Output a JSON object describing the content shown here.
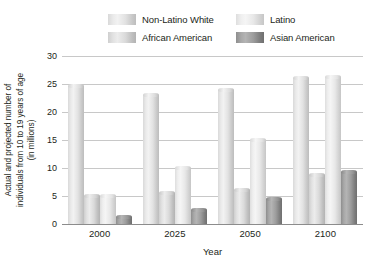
{
  "legend": {
    "items": [
      {
        "label": "Non-Latino White",
        "swatch": "legend-swatch-non-latino-white",
        "color": "#e8e8e8"
      },
      {
        "label": "Latino",
        "swatch": "legend-swatch-latino",
        "color": "#efefef"
      },
      {
        "label": "African American",
        "swatch": "legend-swatch-african-american",
        "color": "#dedede"
      },
      {
        "label": "Asian American",
        "swatch": "legend-swatch-asian-american",
        "color": "#9c9c9c"
      }
    ]
  },
  "axes": {
    "ylabel_line1": "Actual and projected number of",
    "ylabel_line2": "individuals from 10 to 19 years of age",
    "ylabel_line3": "(in millions)",
    "xlabel": "Year",
    "yticks": [
      "30",
      "25",
      "20",
      "15",
      "10",
      "5",
      "0"
    ]
  },
  "chart_data": {
    "type": "bar",
    "title": "",
    "xlabel": "Year",
    "ylabel": "Actual and projected number of individuals from 10 to 19 years of age (in millions)",
    "categories": [
      "2000",
      "2025",
      "2050",
      "2100"
    ],
    "ylim": [
      0,
      30
    ],
    "ytick_step": 5,
    "grid": true,
    "legend_position": "top",
    "series": [
      {
        "name": "Non-Latino White",
        "values": [
          24.7,
          23.0,
          24.0,
          26.0
        ],
        "color": "#e8e8e8"
      },
      {
        "name": "African American",
        "values": [
          5.0,
          5.5,
          6.0,
          8.7
        ],
        "color": "#dedede"
      },
      {
        "name": "Latino",
        "values": [
          5.0,
          10.0,
          15.0,
          26.2
        ],
        "color": "#efefef"
      },
      {
        "name": "Asian American",
        "values": [
          1.2,
          2.5,
          4.5,
          9.2
        ],
        "color": "#9c9c9c"
      }
    ]
  }
}
